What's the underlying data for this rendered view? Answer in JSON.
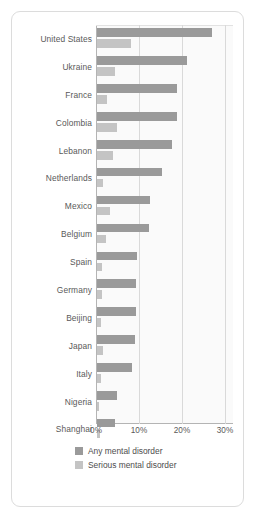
{
  "chart_data": {
    "type": "bar",
    "orientation": "horizontal",
    "title": "",
    "xlabel": "",
    "ylabel": "",
    "xlim": [
      0,
      31.8
    ],
    "xticks": [
      0,
      10,
      20,
      30
    ],
    "xtick_labels": [
      "0%",
      "10%",
      "20%",
      "30%"
    ],
    "grid": true,
    "legend_position": "bottom",
    "categories": [
      "United States",
      "Ukraine",
      "France",
      "Colombia",
      "Lebanon",
      "Netherlands",
      "Mexico",
      "Belgium",
      "Spain",
      "Germany",
      "Beijing",
      "Japan",
      "Italy",
      "Nigeria",
      "Shanghai"
    ],
    "series": [
      {
        "name": "Any mental disorder",
        "color": "#9a9a9a",
        "values": [
          26.8,
          20.9,
          18.7,
          18.5,
          17.4,
          15.1,
          12.3,
          12.1,
          9.2,
          9.1,
          9.1,
          8.8,
          8.2,
          4.7,
          4.3
        ]
      },
      {
        "name": "Serious mental disorder",
        "color": "#c4c4c4",
        "values": [
          7.8,
          4.2,
          2.4,
          4.6,
          3.7,
          1.4,
          3.0,
          2.1,
          1.2,
          1.2,
          0.9,
          1.5,
          1.0,
          0.4,
          0.7
        ]
      }
    ]
  },
  "legend": {
    "items": [
      {
        "label": "Any mental disorder",
        "color": "#9a9a9a"
      },
      {
        "label": "Serious mental disorder",
        "color": "#c4c4c4"
      }
    ]
  }
}
